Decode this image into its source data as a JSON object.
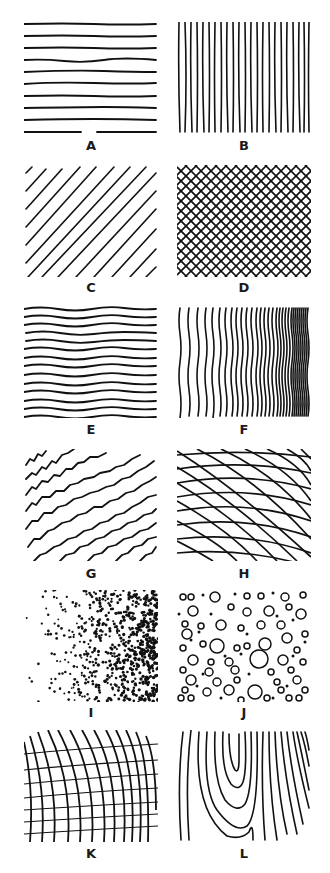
{
  "figure": {
    "panels": [
      {
        "id": "A",
        "label": "A",
        "description": "evenly spaced horizontal lines",
        "line_count": 10
      },
      {
        "id": "B",
        "label": "B",
        "description": "evenly spaced vertical lines",
        "line_count": 23
      },
      {
        "id": "C",
        "label": "C",
        "description": "parallel diagonal lines",
        "line_count": 12
      },
      {
        "id": "D",
        "label": "D",
        "description": "dense cross-hatching"
      },
      {
        "id": "E",
        "label": "E",
        "description": "wavy horizontal lines",
        "line_count": 14
      },
      {
        "id": "F",
        "label": "F",
        "description": "wavy vertical lines increasing in density to the right"
      },
      {
        "id": "G",
        "label": "G",
        "description": "jagged diagonal curved lines"
      },
      {
        "id": "H",
        "label": "H",
        "description": "curved cross-hatching converging to the right"
      },
      {
        "id": "I",
        "label": "I",
        "description": "stipple dots increasing in density to the right"
      },
      {
        "id": "J",
        "label": "J",
        "description": "scattered small circles and dots"
      },
      {
        "id": "K",
        "label": "K",
        "description": "curved grid lines with perspective"
      },
      {
        "id": "L",
        "label": "L",
        "description": "wood-grain contour lines"
      }
    ],
    "caption": ""
  },
  "colors": {
    "ink": "#111111",
    "background": "#ffffff"
  }
}
